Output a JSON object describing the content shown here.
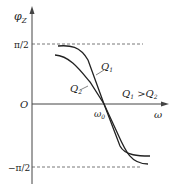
{
  "figure": {
    "y_axis_label": "φ",
    "y_axis_sub": "Z",
    "x_axis_label": "ω",
    "origin_label": "O",
    "top_tick_label": "π/2",
    "bottom_tick_label": "−π/2",
    "crossing_label": "ω",
    "crossing_sub": "0",
    "curve1_label": "Q",
    "curve1_sub": "1",
    "curve2_label": "Q",
    "curve2_sub": "2",
    "relation_a": "Q",
    "relation_a_sub": "1",
    "relation_op": " >",
    "relation_b": "Q",
    "relation_b_sub": "2"
  },
  "colors": {
    "line": "#333333",
    "dashed": "#555555"
  }
}
